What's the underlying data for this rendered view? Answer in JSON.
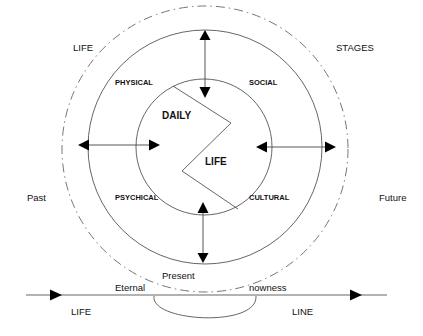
{
  "diagram": {
    "corner_labels": {
      "top_left": "LIFE",
      "top_right": "STAGES",
      "left": "Past",
      "right": "Future"
    },
    "quadrant_labels": {
      "top_left": "PHYSICAL",
      "top_right": "SOCIAL",
      "bottom_left": "PSYCHICAL",
      "bottom_right": "CULTURAL"
    },
    "center_labels": {
      "upper": "DAILY",
      "lower": "LIFE"
    },
    "timeline": {
      "present": "Present",
      "eternal": "Eternal",
      "nowness": "nowness",
      "left_label": "LIFE",
      "right_label": "LINE"
    },
    "colors": {
      "stroke": "#555555",
      "arrow": "#000000",
      "text": "#111111"
    }
  }
}
